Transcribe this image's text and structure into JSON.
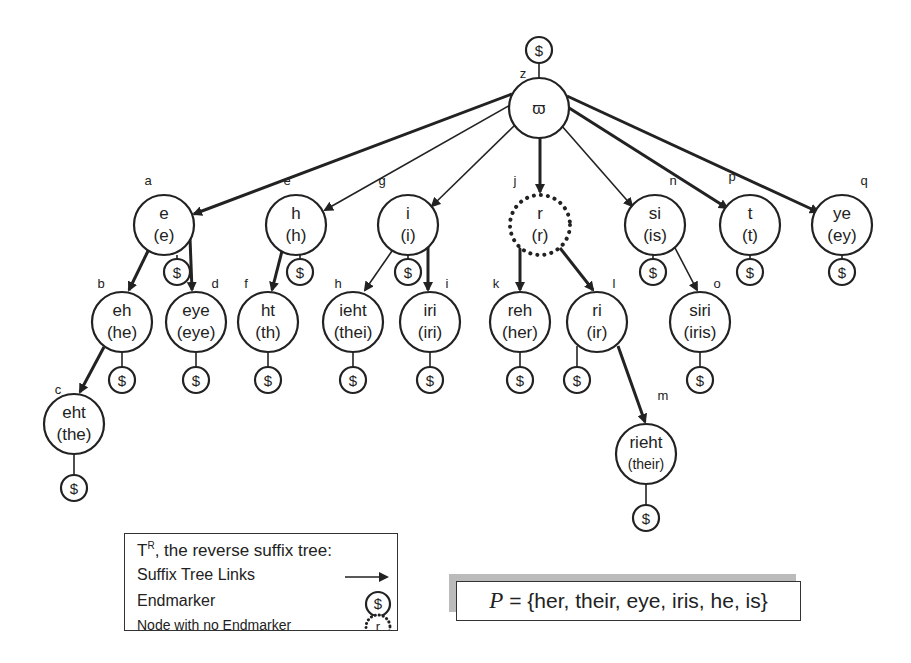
{
  "diagram": {
    "root": {
      "id": "z",
      "label": "ϖ",
      "endmarker": "$"
    },
    "nodes": [
      {
        "id": "a",
        "text": "e",
        "sub": "(e)",
        "parent": "z",
        "endmarker": true
      },
      {
        "id": "e",
        "text": "h",
        "sub": "(h)",
        "parent": "z",
        "endmarker": true
      },
      {
        "id": "g",
        "text": "i",
        "sub": "(i)",
        "parent": "z",
        "endmarker": true
      },
      {
        "id": "j",
        "text": "r",
        "sub": "(r)",
        "parent": "z",
        "endmarker": false
      },
      {
        "id": "n",
        "text": "si",
        "sub": "(is)",
        "parent": "z",
        "endmarker": true
      },
      {
        "id": "p",
        "text": "t",
        "sub": "(t)",
        "parent": "z",
        "endmarker": true
      },
      {
        "id": "q",
        "text": "ye",
        "sub": "(ey)",
        "parent": "z",
        "endmarker": true
      },
      {
        "id": "b",
        "text": "eh",
        "sub": "(he)",
        "parent": "a",
        "endmarker": true
      },
      {
        "id": "d",
        "text": "eye",
        "sub": "(eye)",
        "parent": "a",
        "endmarker": true
      },
      {
        "id": "f",
        "text": "ht",
        "sub": "(th)",
        "parent": "e",
        "endmarker": true
      },
      {
        "id": "h",
        "text": "ieht",
        "sub": "(thei)",
        "parent": "g",
        "endmarker": true
      },
      {
        "id": "i",
        "text": "iri",
        "sub": "(iri)",
        "parent": "g",
        "endmarker": true
      },
      {
        "id": "k",
        "text": "reh",
        "sub": "(her)",
        "parent": "j",
        "endmarker": true
      },
      {
        "id": "l",
        "text": "ri",
        "sub": "(ir)",
        "parent": "j",
        "endmarker": true
      },
      {
        "id": "o",
        "text": "siri",
        "sub": "(iris)",
        "parent": "n",
        "endmarker": true
      },
      {
        "id": "c",
        "text": "eht",
        "sub": "(the)",
        "parent": "b",
        "endmarker": true
      },
      {
        "id": "m",
        "text": "rieht",
        "sub": "(their)",
        "parent": "l",
        "endmarker": true
      }
    ],
    "endmarker_symbol": "$"
  },
  "legend": {
    "title_prefix": "T",
    "title_sup": "R",
    "title_rest": ", the reverse suffix tree:",
    "links_label": "Suffix Tree Links",
    "endmarker_label": "Endmarker",
    "endmarker_symbol": "$",
    "noend_label": "Node with no Endmarker",
    "noend_symbol": "r"
  },
  "pattern_set": {
    "var": "P",
    "text": " = {her, their, eye, iris, he, is}"
  }
}
